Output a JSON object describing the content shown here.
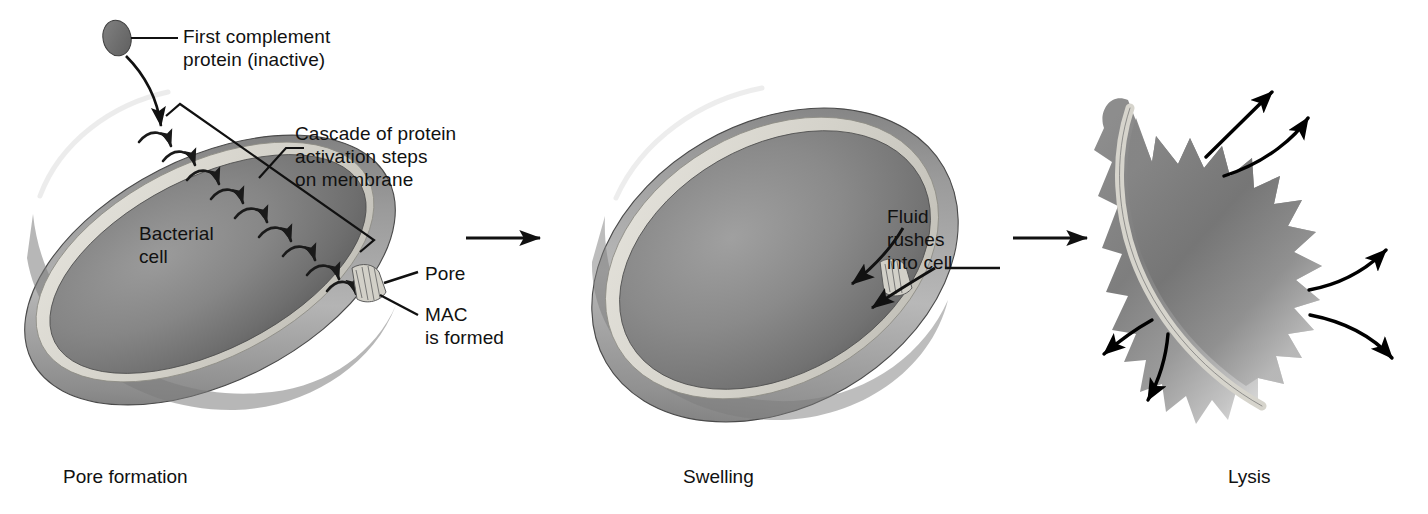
{
  "figure": {
    "type": "biology-process-diagram",
    "stages": 3
  },
  "labels": {
    "first_complement_protein": "First complement\nprotein (inactive)",
    "cascade": "Cascade of protein\nactivation steps\non membrane",
    "bacterial_cell": "Bacterial\ncell",
    "pore": "Pore",
    "mac_is_formed": "MAC\nis formed",
    "fluid_rushes": "Fluid\nrushes\ninto cell"
  },
  "captions": {
    "stage1": "Pore formation",
    "stage2": "Swelling",
    "stage3": "Lysis"
  },
  "icons": {
    "complement_protein": "complement-protein-ellipse-icon",
    "pore_structure": "mac-pore-icon",
    "cascade_arrow": "curved-cascade-arrow-icon",
    "stage_arrow": "right-arrow-icon",
    "inflow_arrow": "curved-inflow-arrow-icon",
    "outflow_arrow": "curved-outflow-arrow-icon",
    "bracket": "diagonal-bracket-icon"
  },
  "counts": {
    "cascade_arrows": 9,
    "inflow_arrows": 2,
    "outflow_arrows": 6,
    "stage_arrows": 2
  },
  "colors": {
    "background": "#ffffff",
    "ink": "#111111",
    "cell_interior_dark": "#6f6f6f",
    "cell_interior_mid": "#8d8d8d",
    "cell_interior_light": "#aeaeae",
    "membrane_highlight": "#d8d6cf",
    "cell_outer_body": "#9b9b9b",
    "cell_outer_shadow": "#6a6a6a",
    "protein_fill": "#6e6e6e",
    "pore_fill": "#cccac3"
  }
}
